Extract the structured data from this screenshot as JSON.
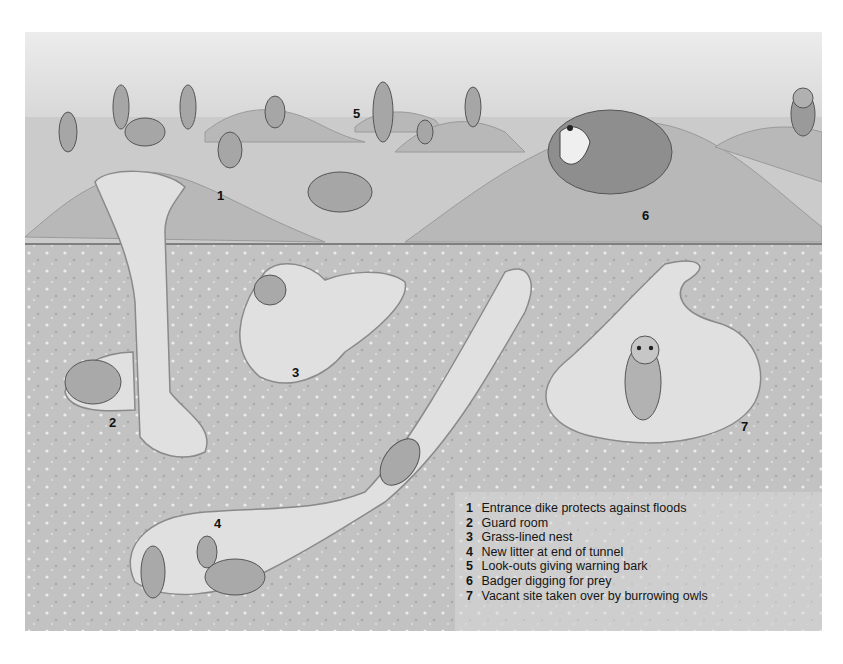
{
  "illustration": {
    "subject": "Prairie dog town cross-section",
    "colors": {
      "sky": "#e6e6e6",
      "surface": "#c9c9c9",
      "mound": "#b9b9b9",
      "soil": "#c4c4c4",
      "chamber": "#e2e2e2",
      "chamber_edge": "#8a8a8a",
      "text": "#151515"
    }
  },
  "markers": [
    {
      "num": "1",
      "x": 192,
      "y": 157
    },
    {
      "num": "2",
      "x": 84,
      "y": 384
    },
    {
      "num": "3",
      "x": 267,
      "y": 334
    },
    {
      "num": "4",
      "x": 189,
      "y": 485
    },
    {
      "num": "5",
      "x": 328,
      "y": 75
    },
    {
      "num": "6",
      "x": 617,
      "y": 177
    },
    {
      "num": "7",
      "x": 716,
      "y": 388
    }
  ],
  "key": [
    {
      "num": "1",
      "text": "Entrance dike protects against floods"
    },
    {
      "num": "2",
      "text": "Guard room"
    },
    {
      "num": "3",
      "text": "Grass-lined nest"
    },
    {
      "num": "4",
      "text": "New litter at end of tunnel"
    },
    {
      "num": "5",
      "text": "Look-outs giving warning bark"
    },
    {
      "num": "6",
      "text": "Badger digging for prey"
    },
    {
      "num": "7",
      "text": "Vacant site taken over by burrowing owls"
    }
  ]
}
